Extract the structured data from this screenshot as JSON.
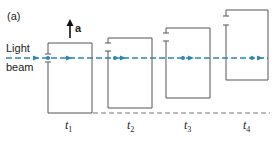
{
  "panel_label": "(a)",
  "acceleration_label": "a",
  "beam_label_line1": "Light",
  "beam_label_line2": "beam",
  "time_labels": [
    {
      "base": "t",
      "sub": "1"
    },
    {
      "base": "t",
      "sub": "2"
    },
    {
      "base": "t",
      "sub": "3"
    },
    {
      "base": "t",
      "sub": "4"
    }
  ],
  "colors": {
    "beam": "#2b86b4",
    "box": "#555555",
    "text": "#222222",
    "baseline": "#777777"
  },
  "boxes": [
    {
      "time": "t1",
      "left": 48,
      "right": 92,
      "top": 43,
      "bottom": 113
    },
    {
      "time": "t2",
      "left": 108,
      "right": 152,
      "top": 38,
      "bottom": 108
    },
    {
      "time": "t3",
      "left": 166,
      "right": 210,
      "top": 28,
      "bottom": 98
    },
    {
      "time": "t4",
      "left": 226,
      "right": 268,
      "top": 10,
      "bottom": 80
    }
  ]
}
